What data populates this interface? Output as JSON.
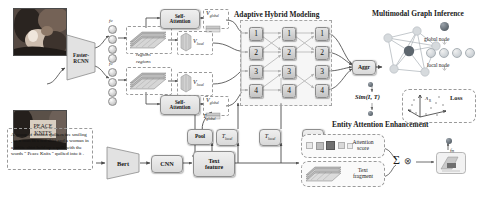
{
  "figure": {
    "type": "architecture-diagram",
    "sections": {
      "adaptive_hybrid_modeling": "Adaptive Hybrid Modeling",
      "multimodal_graph_inference": "Multimodal Graph Inference",
      "entity_attention_enhancement": "Entity Attention Enhancement"
    }
  },
  "visual_branch": {
    "detector_label": "Faster-\nRCNN",
    "detector_label_line1": "Faster-",
    "detector_label_line2": "RCNN",
    "fc_label": "fc",
    "regions_label": "regions",
    "self_attention_label_line1": "Self-",
    "self_attention_label_line2": "Attention",
    "v_global": "V",
    "v_global_sub": "global",
    "v_local": "V",
    "v_local_sub": "local"
  },
  "text_branch": {
    "caption": "A group of women quilters are smiling , as a man in a red shirt and a woman in a white shirt hold up a quilt with the words \" Peace Knits \" quilted into it .",
    "bert_label": "Bert",
    "cnn_label": "CNN",
    "text_feature_line1": "Text",
    "text_feature_line2": "feature",
    "pool_label": "Pool",
    "t_global": "T",
    "t_global_sub": "global",
    "t_local": "T",
    "t_local_sub": "local"
  },
  "grid": {
    "row_labels": [
      "1",
      "2",
      "3",
      "4"
    ],
    "columns": 3,
    "rows": 4
  },
  "aggregation": {
    "label": "Aggr"
  },
  "graph": {
    "legend_global": "global node",
    "legend_local": "local node",
    "local_node_count": 4
  },
  "similarity": {
    "label": "Sim(I, T)"
  },
  "loss": {
    "label": "Loss",
    "axis_label": "A",
    "axis_label_sub": "R"
  },
  "entity_attention": {
    "attention_score_line1": "Attention",
    "attention_score_line2": "score",
    "text_fragment_line1": "Text",
    "text_fragment_line2": "fragment",
    "sum_symbol": "Σ",
    "product_symbol": "⊗",
    "fn_label": "fn"
  },
  "colors": {
    "box_fill_top": "#efefef",
    "box_fill_bottom": "#d9d9d9",
    "box_border": "#8e8e8e",
    "arrow": "#4a4a4a",
    "dashed": "#9a9a9a",
    "global_node": "#5d666e",
    "local_node": "#cfd4d8",
    "text": "#131313"
  }
}
